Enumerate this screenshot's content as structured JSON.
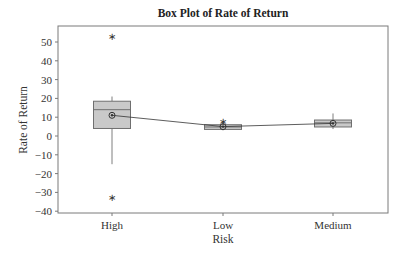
{
  "chart_data": {
    "type": "box",
    "title": "Box Plot of Rate of Return",
    "xlabel": "Risk",
    "ylabel": "Rate of Return",
    "ylim": [
      -41,
      58
    ],
    "yticks": [
      50,
      40,
      30,
      20,
      10,
      0,
      -10,
      -20,
      -30,
      -40
    ],
    "categories": [
      "High",
      "Low",
      "Medium"
    ],
    "grid": false,
    "legend": null,
    "series": [
      {
        "name": "High",
        "whisker_low": -15,
        "q1": 4,
        "median": 14,
        "q3": 18.5,
        "whisker_high": 21,
        "mean": 11,
        "outliers": [
          53,
          -32.5
        ]
      },
      {
        "name": "Low",
        "whisker_low": 3,
        "q1": 3.5,
        "median": 4.8,
        "q3": 6,
        "whisker_high": 6.5,
        "mean": 5,
        "outliers": [
          8
        ]
      },
      {
        "name": "Medium",
        "whisker_low": 3.7,
        "q1": 4.8,
        "median": 7,
        "q3": 8.5,
        "whisker_high": 12,
        "mean": 6.7,
        "outliers": []
      }
    ],
    "mean_connect_line": true
  },
  "colors": {
    "box_fill": "#c9c9c9",
    "box_stroke": "#6f6f6f",
    "frame": "#7a7a7a",
    "line": "#333333"
  }
}
